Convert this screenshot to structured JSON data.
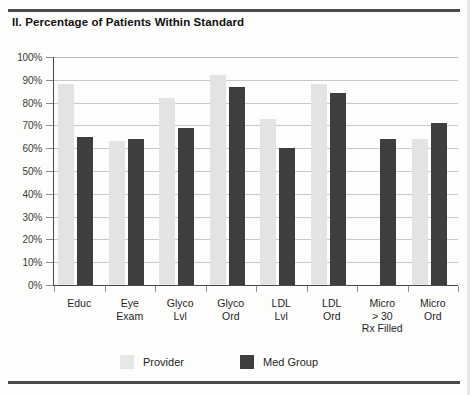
{
  "chart_data": {
    "type": "bar",
    "title": "II. Percentage of Patients Within Standard",
    "xlabel": "",
    "ylabel": "",
    "ylim": [
      0,
      100
    ],
    "grid": true,
    "legend_position": "bottom",
    "categories": [
      [
        "Educ"
      ],
      [
        "Eye",
        "Exam"
      ],
      [
        "Glyco",
        "Lvl"
      ],
      [
        "Glyco",
        "Ord"
      ],
      [
        "LDL",
        "Lvl"
      ],
      [
        "LDL",
        "Ord"
      ],
      [
        "Micro",
        "> 30",
        "Rx Filled"
      ],
      [
        "Micro",
        "Ord"
      ]
    ],
    "ytick_labels": [
      "100%",
      "90%",
      "80%",
      "70%",
      "60%",
      "50%",
      "40%",
      "30%",
      "20%",
      "10%",
      "0%"
    ],
    "ytick_values": [
      100,
      90,
      80,
      70,
      60,
      50,
      40,
      30,
      20,
      10,
      0
    ],
    "series": [
      {
        "name": "Provider",
        "color": "#e3e3e1",
        "values": [
          88,
          63,
          82,
          92,
          73,
          88,
          0,
          64
        ]
      },
      {
        "name": "Med Group",
        "color": "#3e3e3e",
        "values": [
          65,
          64,
          69,
          87,
          60,
          84,
          64,
          71
        ]
      }
    ]
  },
  "legend": {
    "items": [
      {
        "label": "Provider",
        "color": "#e3e3e1"
      },
      {
        "label": "Med Group",
        "color": "#3e3e3e"
      }
    ]
  }
}
